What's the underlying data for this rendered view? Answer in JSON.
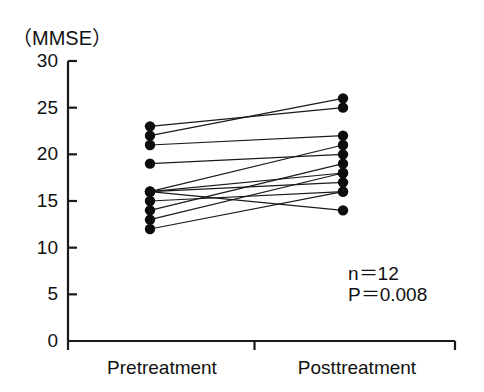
{
  "figure": {
    "axis_unit_label": "（MMSE）",
    "line_color": "#1a1a1a",
    "marker_color": "#0d0d0d",
    "axis_color": "#1a1a1a",
    "background": "#ffffff"
  },
  "annotations": {
    "sample_size": "n＝12",
    "p_value": "P＝0.008"
  },
  "chart_data": {
    "type": "line",
    "title": "",
    "subtitle": "",
    "xlabel": "",
    "ylabel": "（MMSE）",
    "categories": [
      "Pretreatment",
      "Posttreatment"
    ],
    "x_tick_labels": [
      "Pretreatment",
      "Posttreatment"
    ],
    "y_tick_labels": [
      "30",
      "25",
      "20",
      "15",
      "10",
      "5",
      "0"
    ],
    "y_ticks": [
      30,
      25,
      20,
      15,
      10,
      5,
      0
    ],
    "ylim": [
      0,
      30
    ],
    "grid": false,
    "legend": false,
    "legend_position": "none",
    "n": 12,
    "p_value": 0.008,
    "series": [
      {
        "name": "Subject 1",
        "values": [
          23,
          25
        ]
      },
      {
        "name": "Subject 2",
        "values": [
          22,
          26
        ]
      },
      {
        "name": "Subject 3",
        "values": [
          21,
          22
        ]
      },
      {
        "name": "Subject 4",
        "values": [
          19,
          20
        ]
      },
      {
        "name": "Subject 5",
        "values": [
          16,
          21
        ]
      },
      {
        "name": "Subject 6",
        "values": [
          16,
          18
        ]
      },
      {
        "name": "Subject 7",
        "values": [
          16,
          17
        ]
      },
      {
        "name": "Subject 8",
        "values": [
          16,
          14
        ]
      },
      {
        "name": "Subject 9",
        "values": [
          15,
          16
        ]
      },
      {
        "name": "Subject 10",
        "values": [
          14,
          19
        ]
      },
      {
        "name": "Subject 11",
        "values": [
          13,
          18
        ]
      },
      {
        "name": "Subject 12",
        "values": [
          12,
          16
        ]
      }
    ],
    "pretreatment_values": [
      23,
      22,
      21,
      19,
      16,
      16,
      16,
      16,
      15,
      14,
      13,
      12
    ],
    "posttreatment_values": [
      25,
      26,
      22,
      20,
      21,
      18,
      17,
      14,
      16,
      19,
      18,
      16
    ]
  }
}
